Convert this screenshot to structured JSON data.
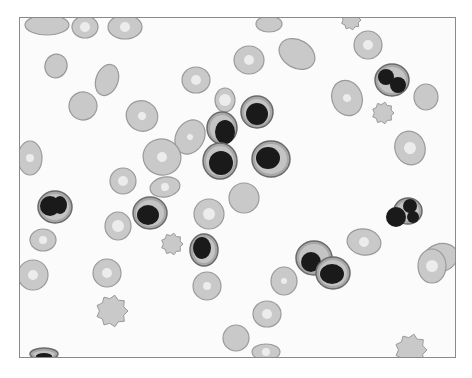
{
  "figure": {
    "frame": {
      "x": 19,
      "y": 17,
      "width": 437,
      "height": 341,
      "border": "#8a8a8a"
    },
    "colors": {
      "background": "#fbfbfb",
      "rbc_fill": "#c9c9c9",
      "rbc_edge": "#9a9a9a",
      "rbc_pallor": "#ececec",
      "nucleus": "#1a1a1a",
      "cytoplasm": "#a8a8a8"
    },
    "rbcs": [
      {
        "cx": 47,
        "cy": 25,
        "rx": 22,
        "ry": 10,
        "rot": 0,
        "pallor": 0
      },
      {
        "cx": 85,
        "cy": 27,
        "rx": 13,
        "ry": 11,
        "rot": 0,
        "pallor": 5
      },
      {
        "cx": 125,
        "cy": 27,
        "rx": 17,
        "ry": 12,
        "rot": 0,
        "pallor": 5
      },
      {
        "cx": 56,
        "cy": 66,
        "rx": 11,
        "ry": 12,
        "rot": 20,
        "pallor": 0
      },
      {
        "cx": 107,
        "cy": 80,
        "rx": 11,
        "ry": 16,
        "rot": 20,
        "pallor": 0
      },
      {
        "cx": 83,
        "cy": 106,
        "rx": 14,
        "ry": 14,
        "rot": -30,
        "pallor": 0
      },
      {
        "cx": 142,
        "cy": 116,
        "rx": 16,
        "ry": 15,
        "rot": 30,
        "pallor": 4
      },
      {
        "cx": 196,
        "cy": 80,
        "rx": 14,
        "ry": 13,
        "rot": 0,
        "pallor": 5
      },
      {
        "cx": 30,
        "cy": 158,
        "rx": 12,
        "ry": 17,
        "rot": 0,
        "pallor": 4
      },
      {
        "cx": 190,
        "cy": 137,
        "rx": 14,
        "ry": 18,
        "rot": 30,
        "pallor": 3
      },
      {
        "cx": 162,
        "cy": 157,
        "rx": 19,
        "ry": 18,
        "rot": 20,
        "pallor": 5
      },
      {
        "cx": 123,
        "cy": 181,
        "rx": 13,
        "ry": 13,
        "rot": 0,
        "pallor": 5
      },
      {
        "cx": 165,
        "cy": 187,
        "rx": 15,
        "ry": 10,
        "rot": -10,
        "pallor": 4
      },
      {
        "cx": 249,
        "cy": 60,
        "rx": 15,
        "ry": 14,
        "rot": 0,
        "pallor": 5
      },
      {
        "cx": 297,
        "cy": 54,
        "rx": 19,
        "ry": 14,
        "rot": 30,
        "pallor": 0
      },
      {
        "cx": 269,
        "cy": 24,
        "rx": 13,
        "ry": 8,
        "rot": 0,
        "pallor": 0
      },
      {
        "cx": 368,
        "cy": 45,
        "rx": 14,
        "ry": 14,
        "rot": 0,
        "pallor": 5
      },
      {
        "cx": 347,
        "cy": 98,
        "rx": 15,
        "ry": 18,
        "rot": -20,
        "pallor": 4
      },
      {
        "cx": 426,
        "cy": 97,
        "rx": 12,
        "ry": 13,
        "rot": 0,
        "pallor": 0
      },
      {
        "cx": 410,
        "cy": 148,
        "rx": 15,
        "ry": 17,
        "rot": -20,
        "pallor": 6
      },
      {
        "cx": 225,
        "cy": 100,
        "rx": 10,
        "ry": 12,
        "rot": 0,
        "pallor": 6
      },
      {
        "cx": 244,
        "cy": 198,
        "rx": 15,
        "ry": 15,
        "rot": 0,
        "pallor": 0
      },
      {
        "cx": 209,
        "cy": 214,
        "rx": 15,
        "ry": 15,
        "rot": 0,
        "pallor": 6
      },
      {
        "cx": 43,
        "cy": 240,
        "rx": 13,
        "ry": 11,
        "rot": 0,
        "pallor": 4
      },
      {
        "cx": 118,
        "cy": 226,
        "rx": 13,
        "ry": 14,
        "rot": 0,
        "pallor": 6
      },
      {
        "cx": 33,
        "cy": 275,
        "rx": 15,
        "ry": 15,
        "rot": 0,
        "pallor": 5
      },
      {
        "cx": 107,
        "cy": 273,
        "rx": 14,
        "ry": 14,
        "rot": 0,
        "pallor": 5
      },
      {
        "cx": 207,
        "cy": 286,
        "rx": 14,
        "ry": 14,
        "rot": 0,
        "pallor": 4
      },
      {
        "cx": 236,
        "cy": 338,
        "rx": 13,
        "ry": 13,
        "rot": 0,
        "pallor": 0
      },
      {
        "cx": 267,
        "cy": 314,
        "rx": 14,
        "ry": 13,
        "rot": 0,
        "pallor": 5
      },
      {
        "cx": 284,
        "cy": 281,
        "rx": 13,
        "ry": 14,
        "rot": 0,
        "pallor": 3
      },
      {
        "cx": 364,
        "cy": 242,
        "rx": 17,
        "ry": 13,
        "rot": 10,
        "pallor": 5
      },
      {
        "cx": 440,
        "cy": 258,
        "rx": 18,
        "ry": 14,
        "rot": -20,
        "pallor": 0
      },
      {
        "cx": 432,
        "cy": 266,
        "rx": 14,
        "ry": 17,
        "rot": 0,
        "pallor": 6
      },
      {
        "cx": 266,
        "cy": 352,
        "rx": 14,
        "ry": 8,
        "rot": 0,
        "pallor": 4
      }
    ],
    "echinocytes": [
      {
        "cx": 383,
        "cy": 113,
        "r": 11
      },
      {
        "cx": 172,
        "cy": 244,
        "r": 11
      },
      {
        "cx": 112,
        "cy": 311,
        "r": 16
      },
      {
        "cx": 411,
        "cy": 350,
        "r": 16
      },
      {
        "cx": 351,
        "cy": 20,
        "r": 10
      }
    ],
    "nucleated_cells": [
      {
        "cx": 257,
        "cy": 112,
        "rx": 16,
        "ry": 16,
        "nuclei": [
          {
            "cx": 257,
            "cy": 114,
            "rx": 11,
            "ry": 11
          }
        ]
      },
      {
        "cx": 222,
        "cy": 128,
        "rx": 15,
        "ry": 16,
        "nuclei": [
          {
            "cx": 225,
            "cy": 132,
            "rx": 10,
            "ry": 12
          }
        ]
      },
      {
        "cx": 220,
        "cy": 161,
        "rx": 17,
        "ry": 18,
        "nuclei": [
          {
            "cx": 221,
            "cy": 163,
            "rx": 12,
            "ry": 12
          }
        ]
      },
      {
        "cx": 271,
        "cy": 159,
        "rx": 19,
        "ry": 18,
        "nuclei": [
          {
            "cx": 268,
            "cy": 158,
            "rx": 12,
            "ry": 11
          }
        ]
      },
      {
        "cx": 392,
        "cy": 80,
        "rx": 17,
        "ry": 16,
        "nuclei": [
          {
            "cx": 386,
            "cy": 77,
            "rx": 8,
            "ry": 8
          },
          {
            "cx": 398,
            "cy": 85,
            "rx": 8,
            "ry": 8
          }
        ]
      },
      {
        "cx": 55,
        "cy": 207,
        "rx": 17,
        "ry": 16,
        "nuclei": [
          {
            "cx": 50,
            "cy": 206,
            "rx": 10,
            "ry": 10
          },
          {
            "cx": 60,
            "cy": 205,
            "rx": 7,
            "ry": 9
          }
        ]
      },
      {
        "cx": 150,
        "cy": 213,
        "rx": 17,
        "ry": 16,
        "nuclei": [
          {
            "cx": 148,
            "cy": 215,
            "rx": 11,
            "ry": 10
          }
        ]
      },
      {
        "cx": 204,
        "cy": 250,
        "rx": 14,
        "ry": 16,
        "nuclei": [
          {
            "cx": 202,
            "cy": 248,
            "rx": 9,
            "ry": 11
          }
        ]
      },
      {
        "cx": 314,
        "cy": 258,
        "rx": 18,
        "ry": 17,
        "nuclei": [
          {
            "cx": 311,
            "cy": 262,
            "rx": 10,
            "ry": 10
          }
        ]
      },
      {
        "cx": 333,
        "cy": 273,
        "rx": 17,
        "ry": 16,
        "nuclei": [
          {
            "cx": 332,
            "cy": 274,
            "rx": 12,
            "ry": 10
          }
        ]
      },
      {
        "cx": 408,
        "cy": 211,
        "rx": 14,
        "ry": 13,
        "nuclei": [
          {
            "cx": 396,
            "cy": 217,
            "rx": 10,
            "ry": 10
          },
          {
            "cx": 410,
            "cy": 206,
            "rx": 7,
            "ry": 7
          },
          {
            "cx": 413,
            "cy": 217,
            "rx": 6,
            "ry": 6
          }
        ]
      },
      {
        "cx": 44,
        "cy": 354,
        "rx": 14,
        "ry": 6,
        "nuclei": [
          {
            "cx": 44,
            "cy": 356,
            "rx": 8,
            "ry": 3
          }
        ]
      }
    ]
  }
}
